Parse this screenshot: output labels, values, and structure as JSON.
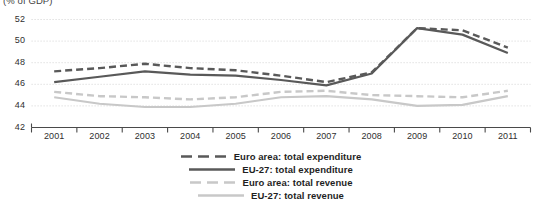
{
  "chart_data": {
    "type": "line",
    "title": "(% of GDP)",
    "xlabel": "",
    "ylabel": "",
    "categories": [
      "2001",
      "2002",
      "2003",
      "2004",
      "2005",
      "2006",
      "2007",
      "2008",
      "2009",
      "2010",
      "2011"
    ],
    "ylim": [
      42,
      52
    ],
    "yticks": [
      42,
      44,
      46,
      48,
      50,
      52
    ],
    "grid": true,
    "legend_position": "bottom",
    "series": [
      {
        "name": "Euro area: total expenditure",
        "color": "#595959",
        "style": "dashed",
        "width": 2.4,
        "values": [
          47.2,
          47.5,
          47.9,
          47.5,
          47.3,
          46.8,
          46.2,
          47.1,
          51.2,
          51.0,
          49.4
        ]
      },
      {
        "name": "EU-27: total expenditure",
        "color": "#595959",
        "style": "solid",
        "width": 2.2,
        "values": [
          46.2,
          46.7,
          47.2,
          46.9,
          46.8,
          46.4,
          45.9,
          47.0,
          51.2,
          50.6,
          48.9
        ]
      },
      {
        "name": "Euro area: total revenue",
        "color": "#c8c8c8",
        "style": "dashed",
        "width": 2.4,
        "values": [
          45.3,
          44.9,
          44.8,
          44.6,
          44.8,
          45.3,
          45.4,
          45.0,
          44.9,
          44.8,
          45.4
        ]
      },
      {
        "name": "EU-27: total revenue",
        "color": "#c8c8c8",
        "style": "solid",
        "width": 2.2,
        "values": [
          44.8,
          44.2,
          43.9,
          43.9,
          44.2,
          44.8,
          44.9,
          44.6,
          44.0,
          44.1,
          44.9
        ]
      }
    ]
  },
  "axes": {
    "y_tick_labels": [
      "52",
      "50",
      "48",
      "46",
      "44",
      "42"
    ],
    "x_tick_labels": [
      "2001",
      "2002",
      "2003",
      "2004",
      "2005",
      "2006",
      "2007",
      "2008",
      "2009",
      "2010",
      "2011"
    ]
  },
  "legend": {
    "items": [
      {
        "label": "Euro area: total expenditure",
        "color": "#595959",
        "style": "dashed"
      },
      {
        "label": "EU-27: total expenditure",
        "color": "#595959",
        "style": "solid"
      },
      {
        "label": "Euro area: total revenue",
        "color": "#c8c8c8",
        "style": "dashed"
      },
      {
        "label": "EU-27: total revenue",
        "color": "#c8c8c8",
        "style": "solid"
      }
    ]
  },
  "colors": {
    "dark_line": "#595959",
    "light_line": "#c8c8c8",
    "axis": "#4a4a4a",
    "grid": "#d9d9d9",
    "text": "#2f2f2f"
  }
}
